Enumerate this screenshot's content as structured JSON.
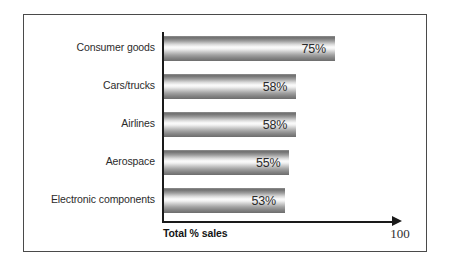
{
  "chart_data": {
    "type": "bar",
    "orientation": "horizontal",
    "title": "",
    "xlabel": "Total % sales",
    "ylabel": "",
    "xlim": [
      0,
      100
    ],
    "grid": false,
    "legend": null,
    "axis_end_label": "100",
    "value_suffix": "%",
    "categories": [
      "Consumer goods",
      "Cars/trucks",
      "Airlines",
      "Aerospace",
      "Electronic components"
    ],
    "values": [
      75,
      58,
      58,
      55,
      53
    ],
    "value_labels": [
      "75%",
      "58%",
      "58%",
      "55%",
      "53%"
    ],
    "bars": [
      {
        "category": "Consumer goods",
        "value": 75,
        "label": "75%"
      },
      {
        "category": "Cars/trucks",
        "value": 58,
        "label": "58%"
      },
      {
        "category": "Airlines",
        "value": 58,
        "label": "58%"
      },
      {
        "category": "Aerospace",
        "value": 55,
        "label": "55%"
      },
      {
        "category": "Electronic components",
        "value": 53,
        "label": "53%"
      }
    ]
  },
  "colors": {
    "frame": "#4a4a4a",
    "axis": "#1a1a1a",
    "bar_light": "#fbfbfb",
    "bar_dark": "#6d6d6d",
    "text": "#2b2b2b",
    "background": "#ffffff"
  }
}
